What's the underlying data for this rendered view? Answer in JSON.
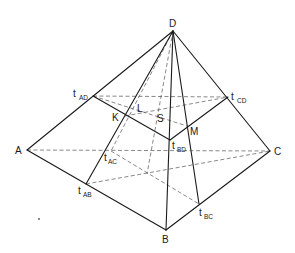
{
  "figure": {
    "type": "tetrahedron-midpoint-construction",
    "vertices": {
      "A": {
        "label": "A",
        "x": 27,
        "y": 150
      },
      "B": {
        "label": "B",
        "x": 166,
        "y": 230
      },
      "C": {
        "label": "C",
        "x": 270,
        "y": 151
      },
      "D": {
        "label": "D",
        "x": 173,
        "y": 31
      }
    },
    "edge_midpoints": {
      "tAD": {
        "main": "t",
        "sub": "AD",
        "x": 93,
        "y": 96
      },
      "tCD": {
        "main": "t",
        "sub": "CD",
        "x": 228,
        "y": 97
      },
      "tBD": {
        "main": "t",
        "sub": "BD",
        "x": 170,
        "y": 140
      },
      "tAC": {
        "main": "t",
        "sub": "AC",
        "x": 111,
        "y": 151
      },
      "tAB": {
        "main": "t",
        "sub": "AB",
        "x": 86,
        "y": 184
      },
      "tBC": {
        "main": "t",
        "sub": "BC",
        "x": 199,
        "y": 204
      }
    },
    "inner_points": {
      "K": {
        "label": "K",
        "x": 125,
        "y": 116
      },
      "L": {
        "label": "L",
        "x": 138,
        "y": 98
      },
      "M": {
        "label": "M",
        "x": 187,
        "y": 126
      },
      "S": {
        "label": "S",
        "x": 159,
        "y": 110
      }
    },
    "labels": {
      "A": "A",
      "B": "B",
      "C": "C",
      "D": "D",
      "K": "K",
      "L": "L",
      "M": "M",
      "S": "S",
      "t": "t",
      "AD": "AD",
      "CD": "CD",
      "BD": "BD",
      "AC": "AC",
      "AB": "AB",
      "BC": "BC"
    },
    "solid_edges": [
      [
        "A",
        "D"
      ],
      [
        "C",
        "D"
      ],
      [
        "A",
        "B"
      ],
      [
        "B",
        "C"
      ],
      [
        "B",
        "D"
      ],
      [
        "tAD",
        "tBD"
      ],
      [
        "tBD",
        "tCD"
      ],
      [
        "D",
        "tAB"
      ],
      [
        "D",
        "tBC"
      ]
    ],
    "dashed_edges": [
      [
        "A",
        "C"
      ],
      [
        "tAD",
        "tCD"
      ],
      [
        "D",
        "tAC"
      ],
      [
        "tAC",
        "tBC"
      ],
      [
        "tAB",
        "C"
      ],
      [
        "K",
        "tCD"
      ],
      [
        "L",
        "M"
      ]
    ],
    "stray_mark": {
      "x": 39,
      "y": 219
    }
  }
}
